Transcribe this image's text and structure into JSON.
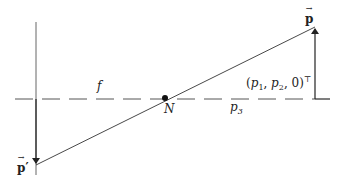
{
  "diagram": {
    "colors": {
      "line": "#333333",
      "axis": "#555555",
      "background": "#ffffff"
    },
    "optical_axis": {
      "y": 99,
      "x1": 15,
      "x2": 330,
      "style": "dashed"
    },
    "image_plane": {
      "x": 36,
      "y1": 22,
      "y2": 175
    },
    "projection_ray": {
      "x1": 36,
      "y1": 165,
      "x2": 315,
      "y2": 27
    },
    "object_arrow": {
      "x": 315,
      "y_base": 99,
      "y_tip": 27
    },
    "image_arrow": {
      "x": 36,
      "y_base": 99,
      "y_tip": 165
    },
    "center_point": {
      "x": 165,
      "y": 98,
      "r": 3
    },
    "labels": {
      "f": "f",
      "N": "N",
      "p3_base": "p",
      "p3_sub": "3",
      "p_vec": "p",
      "p_prime_vec": "p",
      "prime": "′",
      "coords_open": "(",
      "coords_p1": "p",
      "coords_p1_sub": "1",
      "coords_sep1": ", ",
      "coords_p2": "p",
      "coords_p2_sub": "2",
      "coords_sep2": ", 0)",
      "coords_sup": "⊤"
    }
  }
}
